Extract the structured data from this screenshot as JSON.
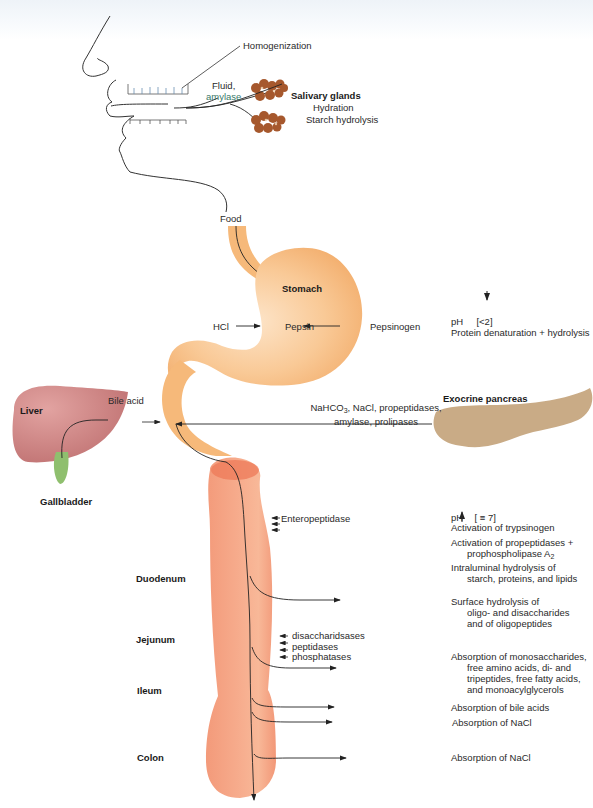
{
  "diagram": {
    "type": "digestive-tract-physiology",
    "colors": {
      "stomach": "#f6bd82",
      "stomach_highlight": "#fbe0c3",
      "intestine": "#f4a07e",
      "intestine_dark": "#ee7a58",
      "liver": "#c97a7a",
      "gallbladder": "#8fbf6e",
      "pancreas": "#c8aa84",
      "salivary": "#a65a30",
      "line": "#222222"
    },
    "mouth": {
      "homogenization": "Homogenization",
      "fluid_line1": "Fluid,",
      "fluid_line2": "amylase",
      "salivary_title": "Salivary glands",
      "salivary_fn1": "Hydration",
      "salivary_fn2": "Starch hydrolysis"
    },
    "stomach": {
      "food": "Food",
      "title": "Stomach",
      "hcl": "HCl",
      "pepsin": "Pepsin",
      "pepsinogen": "Pepsinogen",
      "ph_note": "pH",
      "ph_value": "[<2]",
      "effect": "Protein denaturation + hydrolysis"
    },
    "liver": {
      "title": "Liver",
      "gallbladder": "Gallbladder",
      "bile": "Bile acid"
    },
    "pancreas": {
      "title": "Exocrine pancreas",
      "secretion_line1_pre": "NaHCO",
      "secretion_line1_sub": "3",
      "secretion_line1_post": ", NaCl, propeptidases,",
      "secretion_line2": "amylase, prolipases"
    },
    "intestine": {
      "segments": [
        "Duodenum",
        "Jejunum",
        "Ileum",
        "Colon"
      ],
      "enteropeptidase": "Enteropeptidase",
      "brush_border": [
        "disaccharidsases",
        "peptidases",
        "phosphatases"
      ]
    },
    "right_notes": {
      "ph_up": "pH",
      "ph_up_value": "[ ≡ 7]",
      "trypsinogen": "Activation of trypsinogen",
      "propeptidases_1": "Activation of propeptidases +",
      "propeptidases_2_pre": "prophospholipase A",
      "propeptidases_2_sub": "2",
      "intraluminal_1": "Intraluminal hydrolysis of",
      "intraluminal_2": "starch, proteins, and lipids",
      "surface_1": "Surface hydrolysis of",
      "surface_2": "oligo- and disaccharides",
      "surface_3": "and of oligopeptides",
      "absorb_1": "Absorption of monosaccharides,",
      "absorb_2": "free amino acids, di- and",
      "absorb_3": "tripeptides, free fatty acids,",
      "absorb_4": "and monoacylglycerols",
      "bile_absorb": "Absorption of bile acids",
      "nacl_absorb_ileum": "Absorption of NaCl",
      "nacl_absorb_colon": "Absorption of NaCl"
    },
    "icons": {
      "ph_down": "arrow-down-icon",
      "ph_up": "arrow-up-icon"
    }
  }
}
